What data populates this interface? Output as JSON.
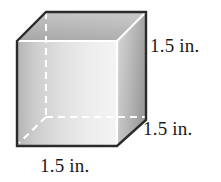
{
  "figure": {
    "shape_name": "cube",
    "labels": {
      "height": "1.5 in.",
      "depth": "1.5 in.",
      "width": "1.5 in."
    },
    "colors": {
      "outline": "#2b2b2b",
      "hidden_edge": "#ffffff",
      "visible_inner_edge": "#ffffff",
      "front_face_light": "#f2f2f2",
      "front_face_dark": "#b8b8b8",
      "top_face_light": "#c9c9c9",
      "top_face_dark": "#a0a0a0",
      "right_face_light": "#d8d8d8",
      "right_face_dark": "#9e9e9e",
      "background": "#ffffff"
    }
  }
}
